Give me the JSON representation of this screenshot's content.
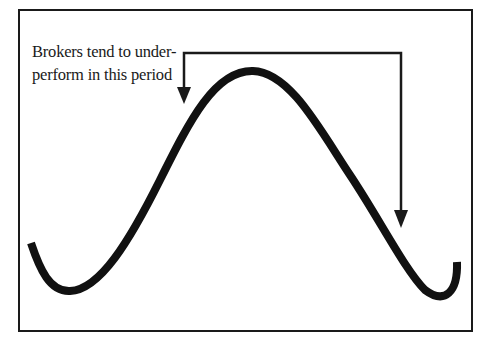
{
  "diagram": {
    "annotation": {
      "line1": "Brokers tend to under-",
      "line2": "perform in this period"
    },
    "curve": {
      "description": "market cycle wave: trough, peak, trough",
      "color": "#111111"
    },
    "bracket": {
      "description": "bracket with two down arrows marking the rising-late and falling-early portions around the peak",
      "color": "#1a1a1a"
    },
    "colors": {
      "background": "#ffffff",
      "ink": "#1a1a1a"
    }
  }
}
